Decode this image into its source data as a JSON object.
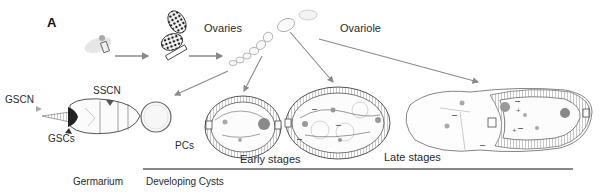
{
  "figure": {
    "panel_label": "A",
    "labels": {
      "ovaries": "Ovaries",
      "ovariole": "Ovariole",
      "gscn": "GSCN",
      "sscn": "SSCN",
      "gscs": "GSCs",
      "pcs": "PCs",
      "early_stages": "Early stages",
      "late_stages": "Late stages",
      "germarium": "Germarium",
      "developing_cysts": "Developing Cysts"
    },
    "colors": {
      "arrow": "#8a8a8a",
      "outline": "#555555",
      "hatch": "#777777",
      "nucleus": "#9a9a9a",
      "rule": "#888888",
      "gsc_dark": "#222222"
    }
  }
}
